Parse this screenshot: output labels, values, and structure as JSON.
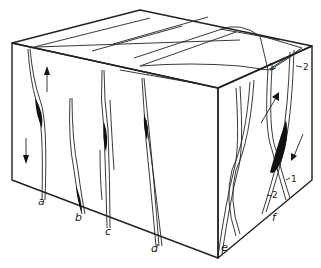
{
  "figure": {
    "type": "block-diagram",
    "vein_labels": [
      "a",
      "b",
      "c",
      "d",
      "e",
      "f"
    ],
    "set_labels": {
      "top": [
        "1",
        "2"
      ],
      "bottom": [
        "2",
        "1"
      ]
    },
    "arrows": {
      "front_left": [
        "up",
        "down"
      ],
      "right_face": [
        "up-right",
        "down-left"
      ]
    }
  }
}
